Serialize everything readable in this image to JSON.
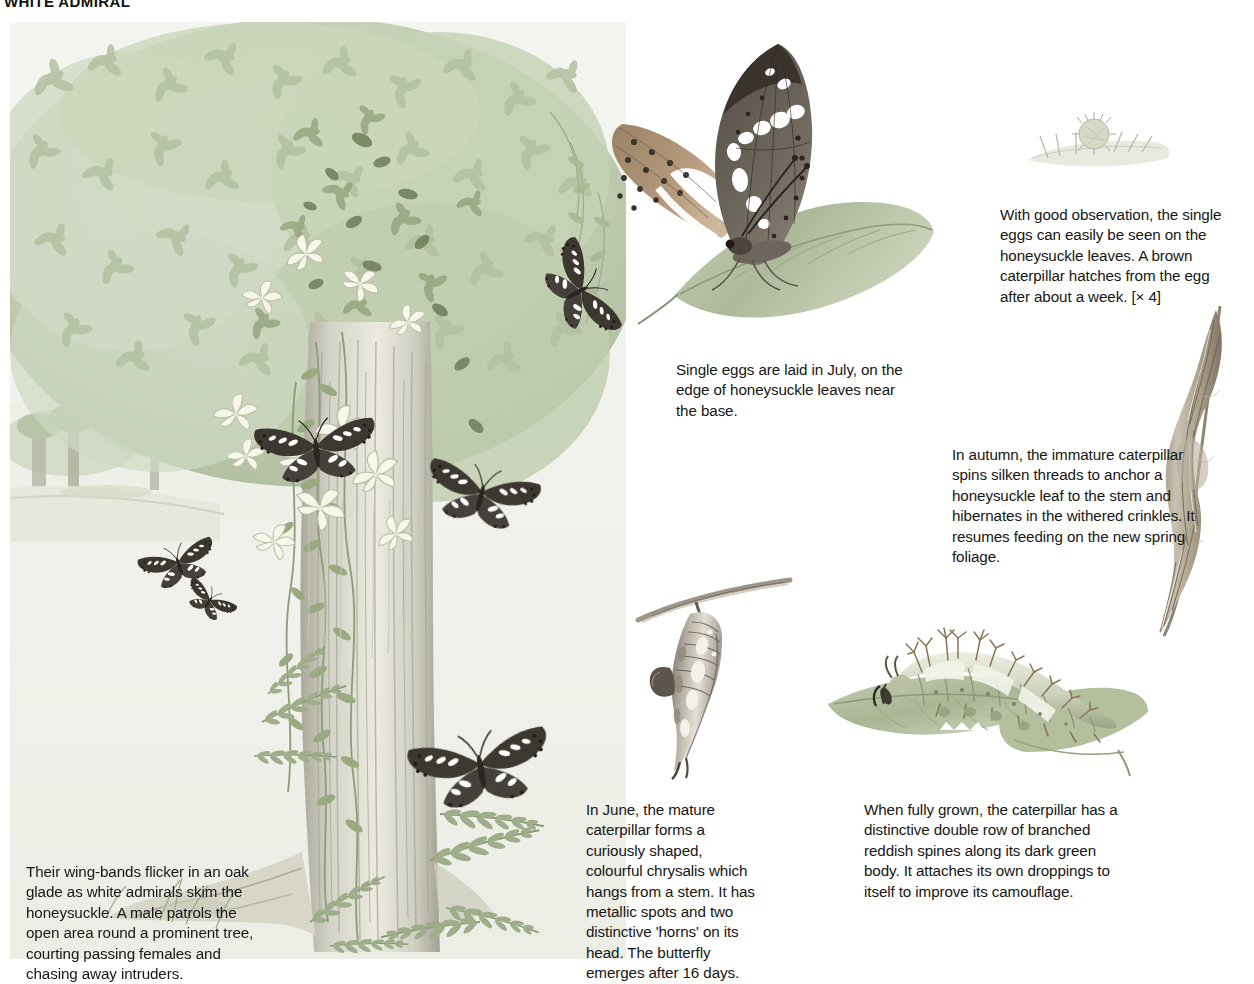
{
  "page": {
    "title": "WHITE ADMIRAL",
    "background_color": "#ffffff",
    "text_color": "#161616"
  },
  "captions": {
    "habitat": "Their wing-bands flicker in an oak glade as white admirals skim the honeysuckle. A male patrols the open area round a prominent tree, courting passing females and chasing away intruders.",
    "eggs": "Single eggs are laid in July, on the edge of honeysuckle leaves near the base.",
    "egg_detail": "With good observation, the single eggs can easily be seen on the honeysuckle leaves. A brown caterpillar hatches from the egg after about a week. [× 4]",
    "autumn": "In autumn, the immature caterpillar spins silken threads to anchor a honeysuckle leaf to the stem and hibernates in the withered crinkles. It resumes feeding on the new spring foliage.",
    "chrysalis": "In June, the mature caterpillar forms a curiously shaped, colourful chrysalis which hangs from a stem. It has metallic spots and two distinctive 'horns' on its head. The butterfly emerges after 16 days.",
    "larva": "When fully grown, the caterpillar has a distinctive double row of branched reddish spines along its dark green body. It attaches its own droppings to itself to improve its camouflage."
  },
  "illustrations": {
    "main_scene": {
      "name": "oak-glade-with-honeysuckle",
      "description": "Watercolour of an oak glade: dense pale-green foliage canopy, a honeysuckle-clad tree trunk, ferns at the base and several white admiral butterflies in flight and at rest.",
      "palette": {
        "foliage_light": "#cfd9c4",
        "foliage_mid": "#a7b596",
        "foliage_dark": "#7d8c6c",
        "foliage_shadow": "#5d6a4e",
        "trunk_light": "#e2e0d6",
        "trunk_mid": "#bdbcae",
        "trunk_dark": "#8e8d80",
        "ground": "#dfe2d4",
        "flower": "#f4f3e4",
        "butterfly_dark": "#3b3630",
        "butterfly_band": "#ffffff",
        "sky": "#f2f3ee"
      }
    },
    "butterfly_on_leaf": {
      "name": "adult-white-admiral-on-leaf",
      "description": "Adult white admiral resting on a honeysuckle leaf, forewing dark brown with white bands, hindwing underside orange-brown with rows of black spots.",
      "palette": {
        "wing_dark": "#4e4740",
        "wing_band": "#ffffff",
        "underwing": "#b08b63",
        "underwing_shade": "#8d6d4b",
        "spots": "#2a2520",
        "leaf": "#b8c3a4",
        "leaf_shade": "#97a383"
      }
    },
    "egg_on_leaf": {
      "name": "honeysuckle-leaf-edge-with-egg",
      "description": "Magnified leaf edge bearing a single pale spiny egg. [× 4]",
      "palette": {
        "leaf": "#e4e8dc",
        "egg": "#c9cdbc",
        "hairs": "#aeb3a2"
      }
    },
    "hibernaculum": {
      "name": "withered-honeysuckle-leaf-hibernaculum",
      "description": "A dried, curled and crinkled honeysuckle leaf spun to the stem, in which the immature caterpillar hibernates.",
      "palette": {
        "leaf_light": "#d8d3c6",
        "leaf_mid": "#a99f8c",
        "leaf_dark": "#7a7263"
      }
    },
    "chrysalis": {
      "name": "chrysalis-hanging-from-stem",
      "description": "Curiously shaped chrysalis with metallic spots and two horns, hanging head-down from a stem.",
      "palette": {
        "body_light": "#ded9cf",
        "body_mid": "#a9a296",
        "body_dark": "#5d564d",
        "stem": "#9a9487"
      }
    },
    "caterpillar": {
      "name": "full-grown-caterpillar-on-leaf",
      "description": "Full-grown green caterpillar with a double row of branched reddish spines, resting on a honeysuckle leaf.",
      "palette": {
        "body_light": "#e1e4d2",
        "body_mid": "#b2b79c",
        "spines": "#8b7a5c",
        "leaf": "#b9c2a6",
        "leaf_shade": "#98a382"
      }
    }
  }
}
